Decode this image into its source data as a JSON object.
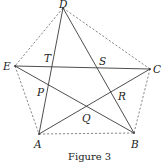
{
  "figure": {
    "caption": "Figure 3",
    "points": {
      "A": {
        "label": "A",
        "x": 39,
        "y": 134
      },
      "B": {
        "label": "B",
        "x": 134,
        "y": 133
      },
      "C": {
        "label": "C",
        "x": 150,
        "y": 69
      },
      "D": {
        "label": "D",
        "x": 63,
        "y": 8
      },
      "E": {
        "label": "E",
        "x": 15,
        "y": 66
      }
    },
    "intersection_labels": {
      "T": "T",
      "S": "S",
      "P": "P",
      "R": "R",
      "Q": "Q"
    },
    "pentagon_edges_style": "dashed",
    "star_diagonals_style": "solid",
    "stroke_color": "#3a3a3a"
  }
}
